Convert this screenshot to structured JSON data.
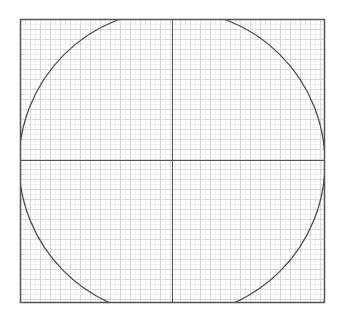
{
  "diagram": {
    "type": "circle-on-grid",
    "frame": {
      "x": 20,
      "y": 19,
      "width": 304,
      "height": 283,
      "stroke": "#555555"
    },
    "grid": {
      "spacing": 10,
      "minor_spacing": 5,
      "major_color": "#d9d9d9",
      "minor_color": "#eeeeee"
    },
    "axes": {
      "vertical_x": 172,
      "horizontal_y": 160,
      "stroke": "#555555"
    },
    "circle": {
      "cx": 172,
      "cy": 163,
      "r": 153,
      "stroke": "#444444"
    },
    "colors": {
      "background": "#ffffff"
    }
  }
}
